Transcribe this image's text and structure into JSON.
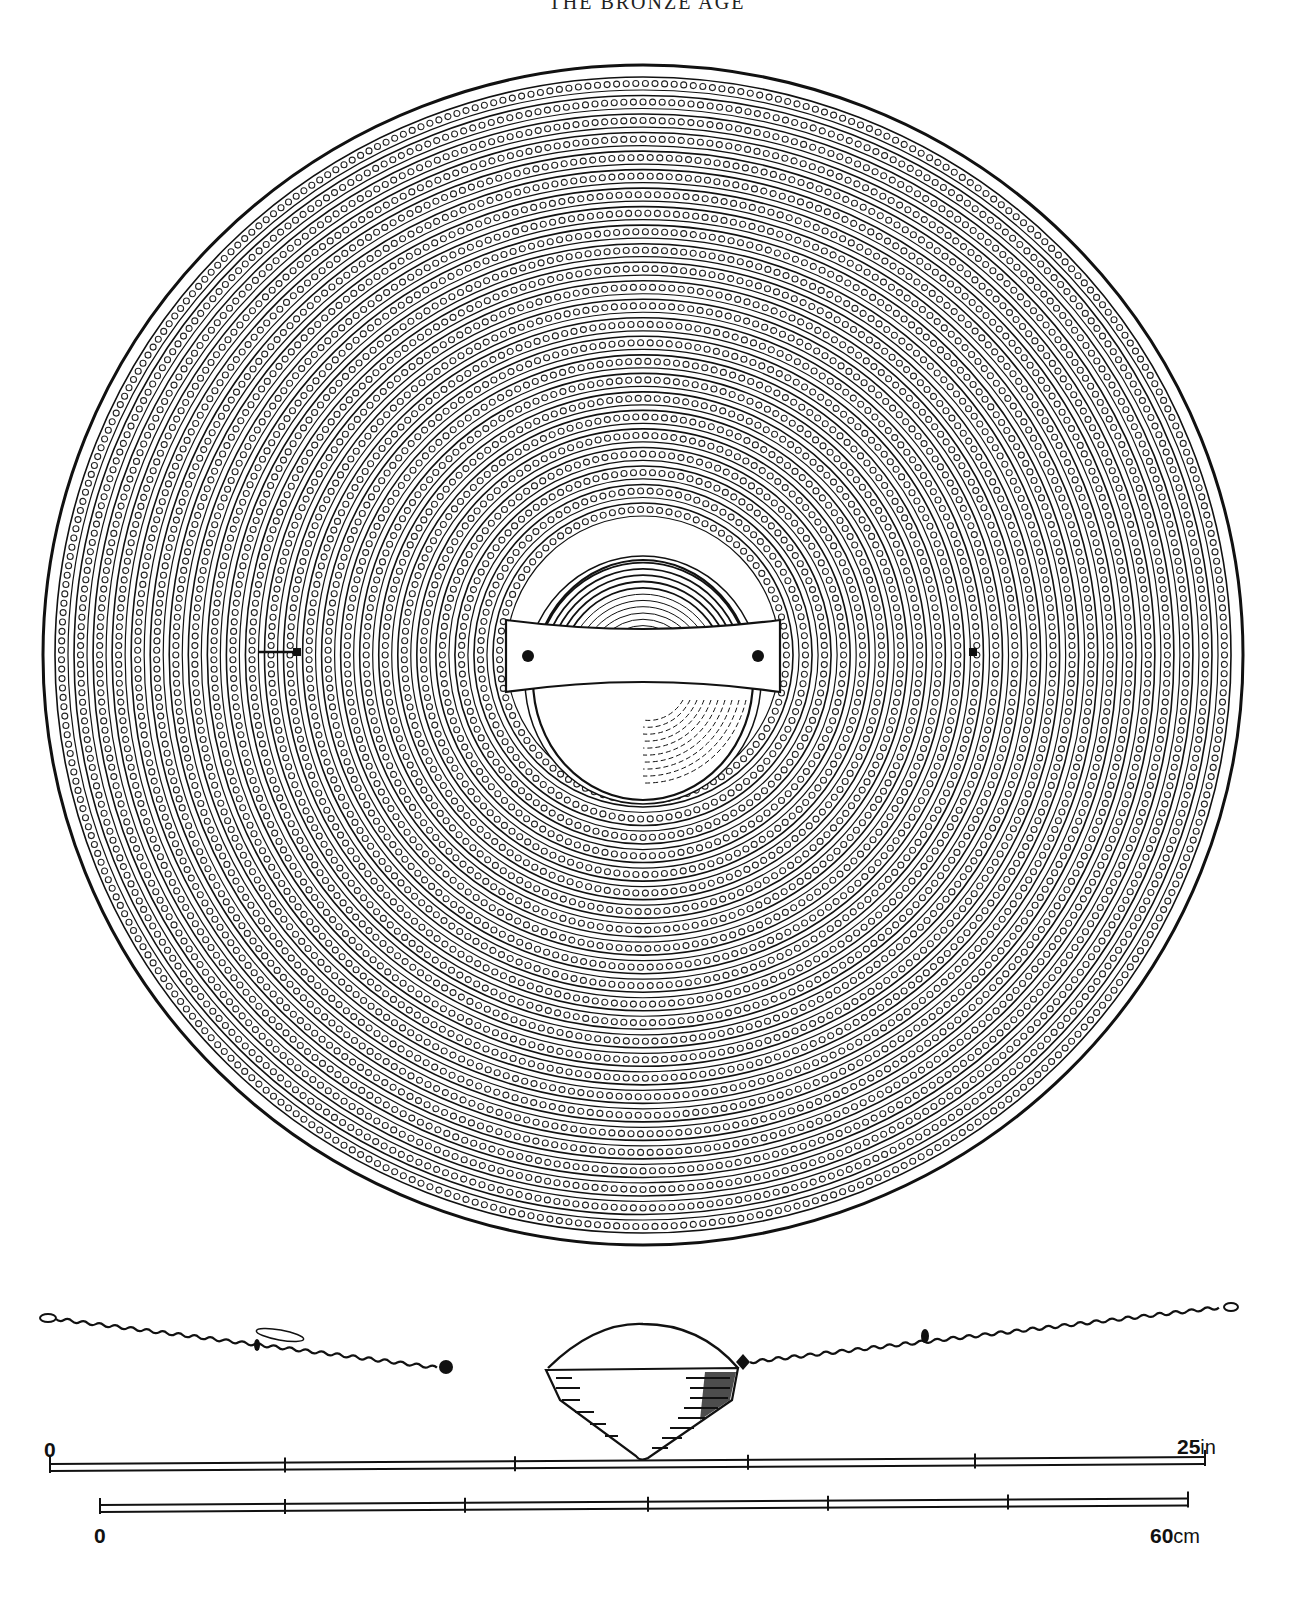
{
  "page": {
    "running_head": "THE BRONZE AGE",
    "page_number": "",
    "caption": ""
  },
  "figure": {
    "views": [
      "plan-view",
      "side-profile"
    ],
    "plan_view": {
      "center": [
        643,
        655
      ],
      "radius_x": 600,
      "radius_y": 590,
      "ring_bands": 24,
      "decoration": "concentric ribs with rows of small bosses",
      "boss": {
        "center": [
          643,
          680
        ],
        "radius_x": 110,
        "radius_y": 120
      },
      "handle": {
        "x": 506,
        "y": 620,
        "width": 274,
        "height": 72
      },
      "strap_fittings": [
        [
          297,
          652
        ],
        [
          973,
          652
        ]
      ]
    },
    "colors": {
      "ink": "#111111",
      "paper": "#ffffff"
    }
  },
  "scales": {
    "imperial": {
      "start_label": "0",
      "end_value": "25",
      "end_unit": "in",
      "ticks_x": [
        50,
        285,
        515,
        748,
        975,
        1205
      ],
      "y": 1467
    },
    "metric": {
      "start_label": "0",
      "end_value": "60",
      "end_unit": "cm",
      "ticks_x": [
        100,
        285,
        465,
        648,
        828,
        1008,
        1188
      ],
      "y": 1508
    }
  }
}
